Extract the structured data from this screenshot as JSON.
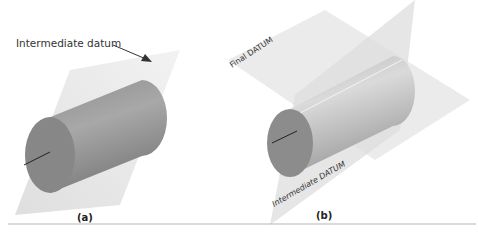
{
  "figure": {
    "panel_a": {
      "caption": "(a)",
      "annotation": "Intermediate datum",
      "planes": [
        "intermediate datum plane"
      ],
      "object": "cylinder"
    },
    "panel_b": {
      "caption": "(b)",
      "plane_labels": {
        "final": "Final DATUM",
        "intermediate": "Intermediate DATUM"
      },
      "object": "cylinder"
    }
  },
  "colors": {
    "plane": "#e6e6e6",
    "cylinder_body": "#9a9a9a",
    "cylinder_face": "#8a8a8a",
    "axis_line": "#222222",
    "rule": "#b5b5b5"
  }
}
